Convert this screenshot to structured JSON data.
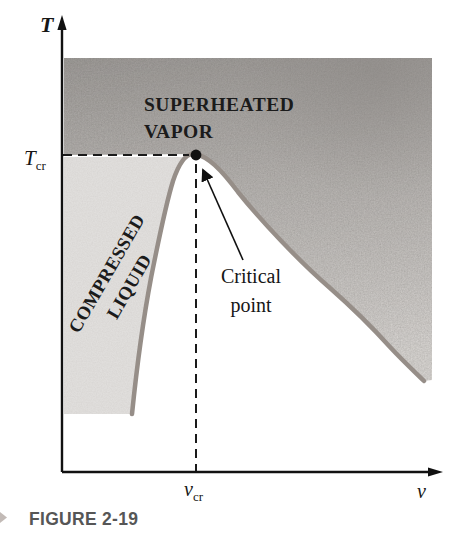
{
  "figure": {
    "kind": "T-v property diagram of a pure substance",
    "caption": {
      "text": "FIGURE 2-19"
    }
  },
  "chart": {
    "axes": {
      "y_label": "T",
      "x_label": "v",
      "y_tick": {
        "base": "T",
        "sub": "cr"
      },
      "x_tick": {
        "base": "v",
        "sub": "cr"
      }
    },
    "regions": {
      "superheated": {
        "line1": "SUPERHEATED",
        "line2": "VAPOR"
      },
      "compressed": {
        "line1": "COMPRESSED",
        "line2": "LIQUID"
      }
    },
    "annotation": {
      "line1": "Critical",
      "line2": "point"
    },
    "colors": {
      "curve": "#968e88",
      "vapor_shade_top": "#9f9c99",
      "vapor_shade_bottom": "#d8d5d2",
      "liquid_shade": "#e0dedc",
      "axis": "#111111",
      "caption_text": "#565656"
    }
  }
}
